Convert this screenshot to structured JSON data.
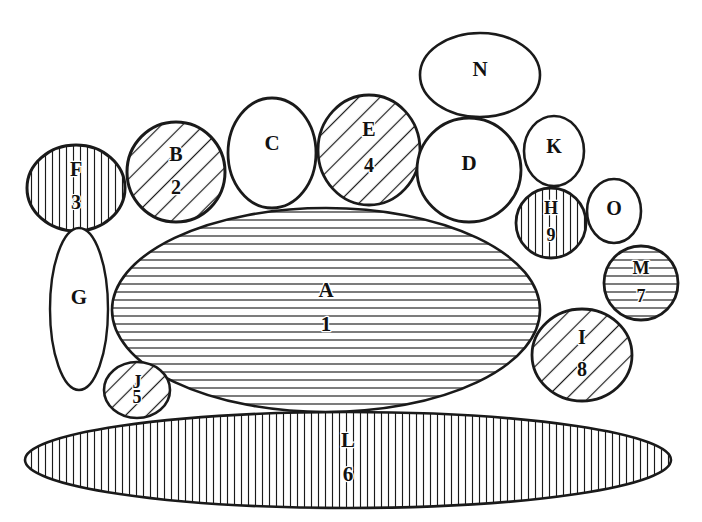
{
  "figure": {
    "background_color": "#ffffff",
    "line_color": "#1a1a1a",
    "label_color": "#111111",
    "width": 702,
    "height": 522
  },
  "legend_note": "",
  "shapes": [
    {
      "id": "A",
      "letter": "A",
      "number": "1",
      "fill_pattern": "horizontal-hatch",
      "cx": 326,
      "cy": 310,
      "rx": 214,
      "ry": 102,
      "rotation": 0,
      "stroke_width": 2.6,
      "label_font_size": 21,
      "label_offset_y": -18,
      "number_offset_y": 16
    },
    {
      "id": "L",
      "letter": "L",
      "number": "6",
      "fill_pattern": "vertical-hatch",
      "cx": 348,
      "cy": 460,
      "rx": 323,
      "ry": 48,
      "rotation": 0,
      "stroke_width": 2.6,
      "label_font_size": 21,
      "label_offset_y": -18,
      "number_offset_y": 16
    },
    {
      "id": "F",
      "letter": "F",
      "number": "3",
      "fill_pattern": "vertical-hatch",
      "cx": 76,
      "cy": 188,
      "rx": 49,
      "ry": 43,
      "rotation": 0,
      "stroke_width": 3.0,
      "label_font_size": 20,
      "label_offset_y": -17,
      "number_offset_y": 16
    },
    {
      "id": "G",
      "letter": "G",
      "number": "",
      "fill_pattern": "none",
      "cx": 79,
      "cy": 309,
      "rx": 29,
      "ry": 81,
      "rotation": 0,
      "stroke_width": 2.4,
      "label_font_size": 21,
      "label_offset_y": -22,
      "number_offset_y": 16
    },
    {
      "id": "B",
      "letter": "B",
      "number": "2",
      "fill_pattern": "diagonal-hatch",
      "cx": 176,
      "cy": 172,
      "rx": 49,
      "ry": 50,
      "rotation": 0,
      "stroke_width": 3.0,
      "label_font_size": 20,
      "label_offset_y": -16,
      "number_offset_y": 17
    },
    {
      "id": "C",
      "letter": "C",
      "number": "",
      "fill_pattern": "none",
      "cx": 272,
      "cy": 153,
      "rx": 44,
      "ry": 55,
      "rotation": 0,
      "stroke_width": 2.8,
      "label_font_size": 21,
      "label_offset_y": -18,
      "number_offset_y": 16
    },
    {
      "id": "E",
      "letter": "E",
      "number": "4",
      "fill_pattern": "diagonal-hatch",
      "cx": 369,
      "cy": 150,
      "rx": 51,
      "ry": 55,
      "rotation": 0,
      "stroke_width": 2.8,
      "label_font_size": 20,
      "label_offset_y": -19,
      "number_offset_y": 17
    },
    {
      "id": "D",
      "letter": "D",
      "number": "",
      "fill_pattern": "none",
      "cx": 469,
      "cy": 170,
      "rx": 52,
      "ry": 52,
      "rotation": 0,
      "stroke_width": 2.8,
      "label_font_size": 21,
      "label_offset_y": -12,
      "number_offset_y": 16
    },
    {
      "id": "N",
      "letter": "N",
      "number": "",
      "fill_pattern": "none",
      "cx": 480,
      "cy": 75,
      "rx": 60,
      "ry": 42,
      "rotation": 0,
      "stroke_width": 2.6,
      "label_font_size": 21,
      "label_offset_y": -8,
      "number_offset_y": 16
    },
    {
      "id": "K",
      "letter": "K",
      "number": "",
      "fill_pattern": "none",
      "cx": 554,
      "cy": 151,
      "rx": 30,
      "ry": 35,
      "rotation": 0,
      "stroke_width": 2.6,
      "label_font_size": 20,
      "label_offset_y": -6,
      "number_offset_y": 16
    },
    {
      "id": "H",
      "letter": "H",
      "number": "9",
      "fill_pattern": "vertical-hatch",
      "cx": 551,
      "cy": 223,
      "rx": 35,
      "ry": 35,
      "rotation": 0,
      "stroke_width": 2.8,
      "label_font_size": 18,
      "label_offset_y": -13,
      "number_offset_y": 14
    },
    {
      "id": "O",
      "letter": "O",
      "number": "",
      "fill_pattern": "none",
      "cx": 614,
      "cy": 211,
      "rx": 27,
      "ry": 32,
      "rotation": 0,
      "stroke_width": 2.6,
      "label_font_size": 20,
      "label_offset_y": -2,
      "number_offset_y": 16
    },
    {
      "id": "M",
      "letter": "M",
      "number": "7",
      "fill_pattern": "horizontal-hatch",
      "cx": 641,
      "cy": 283,
      "rx": 37,
      "ry": 37,
      "rotation": 0,
      "stroke_width": 2.8,
      "label_font_size": 18,
      "label_offset_y": -13,
      "number_offset_y": 15
    },
    {
      "id": "I",
      "letter": "I",
      "number": "8",
      "fill_pattern": "diagonal-hatch",
      "cx": 582,
      "cy": 355,
      "rx": 50,
      "ry": 46,
      "rotation": 0,
      "stroke_width": 2.8,
      "label_font_size": 20,
      "label_offset_y": -16,
      "number_offset_y": 16
    },
    {
      "id": "J",
      "letter": "J",
      "number": "5",
      "fill_pattern": "diagonal-hatch",
      "cx": 137,
      "cy": 390,
      "rx": 33,
      "ry": 28,
      "rotation": 0,
      "stroke_width": 2.6,
      "label_font_size": 18,
      "label_offset_y": -6,
      "number_offset_y": 9
    }
  ]
}
